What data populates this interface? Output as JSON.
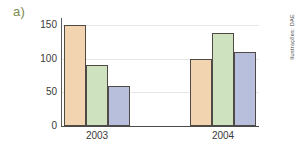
{
  "panel": {
    "label": "a)",
    "label_color": "#7b8a4e"
  },
  "credit": {
    "text": "Ilustrações: DAE"
  },
  "chart_data": {
    "type": "bar",
    "title": "",
    "subtitle": "",
    "xlabel": "",
    "ylabel": "",
    "categories": [
      "2003",
      "2004"
    ],
    "series": [
      {
        "name": "series-1",
        "color": "#f2d5b0",
        "values": [
          150,
          100
        ]
      },
      {
        "name": "series-2",
        "color": "#cfe2c0",
        "values": [
          90,
          138
        ]
      },
      {
        "name": "series-3",
        "color": "#b8bfdd",
        "values": [
          60,
          110
        ]
      }
    ],
    "ylim": [
      0,
      160
    ],
    "yticks": [
      0,
      50,
      100,
      150
    ],
    "ytick_labels": [
      "0",
      "50",
      "100",
      "150"
    ],
    "grid": true,
    "legend": "none",
    "bar_border_color": "#4f4a46"
  },
  "geometry": {
    "plot_left": 62,
    "plot_top": 18,
    "plot_width": 197,
    "plot_height": 108,
    "baseline_y": 126,
    "bar_width": 22,
    "group_starts": [
      2,
      128
    ],
    "group_label_centers": [
      97,
      223
    ]
  }
}
